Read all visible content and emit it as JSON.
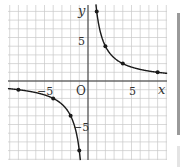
{
  "chart_data": {
    "type": "line",
    "title": "",
    "function": "y = 8/x",
    "xlabel": "x",
    "ylabel": "y",
    "origin_label": "O",
    "xlim": [
      -9,
      9
    ],
    "ylim": [
      -9,
      9
    ],
    "grid": true,
    "x_tick_labels": [
      {
        "value": -5,
        "label": "−5"
      },
      {
        "value": 5,
        "label": "5"
      }
    ],
    "y_tick_labels": [
      {
        "value": 5,
        "label": "5"
      },
      {
        "value": -5,
        "label": "−5"
      }
    ],
    "series": [
      {
        "name": "branch-positive",
        "points": [
          [
            1,
            8
          ],
          [
            2,
            4
          ],
          [
            4,
            2
          ],
          [
            8,
            1
          ]
        ]
      },
      {
        "name": "branch-negative",
        "points": [
          [
            -8,
            -1
          ],
          [
            -4,
            -2
          ],
          [
            -2,
            -4
          ],
          [
            -1,
            -8
          ]
        ]
      }
    ],
    "colors": {
      "curve": "#1a1a1a",
      "grid": "#c8c8c8",
      "axis": "#333333"
    }
  },
  "labels": {
    "x_axis": "x",
    "y_axis": "y",
    "origin": "O",
    "x_pos5": "5",
    "x_neg5": "−5",
    "y_pos5": "5",
    "y_neg5": "−5"
  }
}
